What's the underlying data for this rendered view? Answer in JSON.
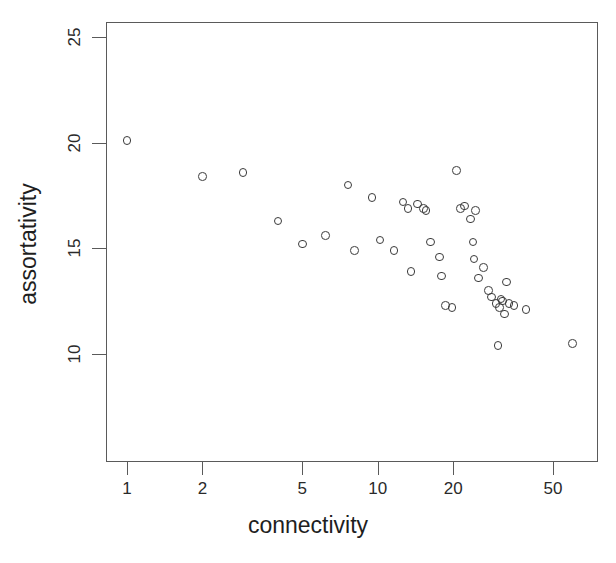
{
  "chart_data": {
    "type": "scatter",
    "title": "",
    "subtitle": "",
    "xlabel": "connectivity",
    "ylabel": "assortativity",
    "xscale": "log",
    "yscale": "linear",
    "grid": false,
    "legend": null,
    "legend_position": "none",
    "xlim": [
      0.83,
      73
    ],
    "ylim": [
      7.0,
      25.9
    ],
    "xticks": [
      1,
      2,
      5,
      10,
      20,
      50
    ],
    "xtick_labels": [
      "1",
      "2",
      "5",
      "10",
      "20",
      "50"
    ],
    "yticks": [
      10,
      15,
      20,
      25
    ],
    "ytick_labels": [
      "10",
      "15",
      "20",
      "25"
    ],
    "marker": "open-circle",
    "marker_color": "#3b3b3b",
    "marker_size": 8.6,
    "axis_color": "#5a5a5a",
    "background": "#ffffff",
    "n_points": 44,
    "points": [
      {
        "x": 1.0,
        "y": 20.1
      },
      {
        "x": 2.0,
        "y": 18.4
      },
      {
        "x": 2.9,
        "y": 18.6
      },
      {
        "x": 4.0,
        "y": 16.3
      },
      {
        "x": 5.0,
        "y": 15.2
      },
      {
        "x": 6.2,
        "y": 15.6
      },
      {
        "x": 7.6,
        "y": 18.0
      },
      {
        "x": 8.1,
        "y": 14.9
      },
      {
        "x": 9.5,
        "y": 17.4
      },
      {
        "x": 10.2,
        "y": 15.4
      },
      {
        "x": 11.6,
        "y": 14.9
      },
      {
        "x": 12.6,
        "y": 17.2
      },
      {
        "x": 13.2,
        "y": 16.9
      },
      {
        "x": 13.6,
        "y": 13.9
      },
      {
        "x": 15.2,
        "y": 16.9
      },
      {
        "x": 15.6,
        "y": 16.8
      },
      {
        "x": 16.2,
        "y": 15.3
      },
      {
        "x": 17.6,
        "y": 14.6
      },
      {
        "x": 18.0,
        "y": 13.7
      },
      {
        "x": 18.6,
        "y": 12.3
      },
      {
        "x": 19.8,
        "y": 12.2
      },
      {
        "x": 20.6,
        "y": 18.7
      },
      {
        "x": 22.2,
        "y": 17.0
      },
      {
        "x": 23.4,
        "y": 16.4
      },
      {
        "x": 24.0,
        "y": 15.3
      },
      {
        "x": 24.2,
        "y": 14.5
      },
      {
        "x": 24.6,
        "y": 16.8
      },
      {
        "x": 25.2,
        "y": 13.6
      },
      {
        "x": 27.6,
        "y": 13.0
      },
      {
        "x": 29.6,
        "y": 12.4
      },
      {
        "x": 30.6,
        "y": 12.2
      },
      {
        "x": 31.0,
        "y": 12.6
      },
      {
        "x": 31.4,
        "y": 12.5
      },
      {
        "x": 32.0,
        "y": 11.9
      },
      {
        "x": 32.6,
        "y": 13.4
      },
      {
        "x": 33.4,
        "y": 12.4
      },
      {
        "x": 30.2,
        "y": 10.4
      },
      {
        "x": 39.0,
        "y": 12.1
      },
      {
        "x": 60.0,
        "y": 10.5
      },
      {
        "x": 14.4,
        "y": 17.1
      },
      {
        "x": 21.4,
        "y": 16.9
      },
      {
        "x": 26.4,
        "y": 14.1
      },
      {
        "x": 28.4,
        "y": 12.7
      },
      {
        "x": 35.0,
        "y": 12.3
      }
    ]
  }
}
